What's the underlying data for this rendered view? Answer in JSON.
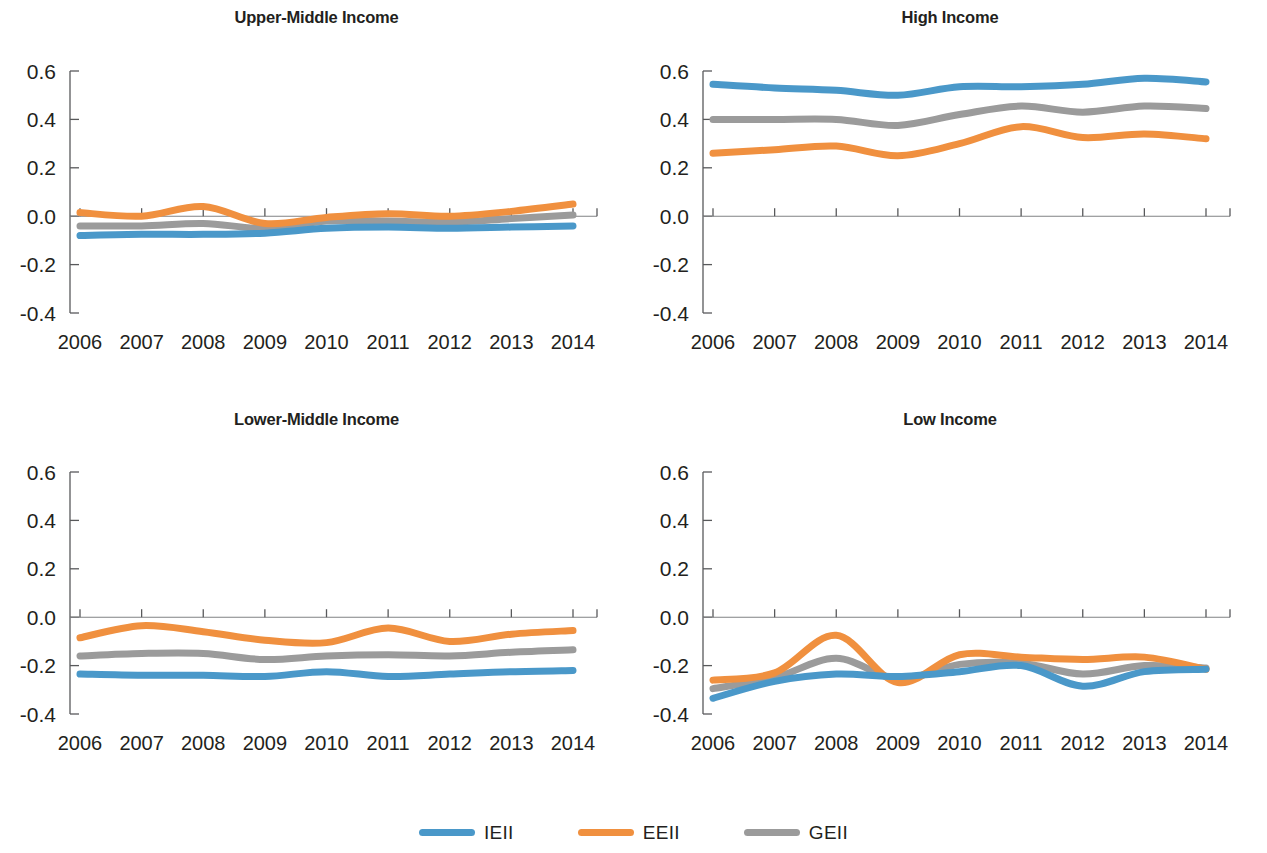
{
  "figure": {
    "series_colors": {
      "IEII": "#4a98c9",
      "EEII": "#f0903f",
      "GEII": "#9b9b9b"
    },
    "legend": {
      "position": "bottom-center",
      "items": [
        {
          "label": "IEII",
          "color": "#4a98c9",
          "icon": "line-swatch"
        },
        {
          "label": "EEII",
          "color": "#f0903f",
          "icon": "line-swatch"
        },
        {
          "label": "GEII",
          "color": "#9b9b9b",
          "icon": "line-swatch"
        }
      ]
    },
    "y_ticks": [
      "0.6",
      "0.4",
      "0.2",
      "0.0",
      "-0.2",
      "-0.4"
    ],
    "x_ticks": [
      "2006",
      "2007",
      "2008",
      "2009",
      "2010",
      "2011",
      "2012",
      "2013",
      "2014"
    ]
  },
  "panels": [
    {
      "title": "Upper-Middle Income"
    },
    {
      "title": "High Income"
    },
    {
      "title": "Lower-Middle Income"
    },
    {
      "title": "Low Income"
    }
  ],
  "chart_data": [
    {
      "type": "line",
      "title": "Upper-Middle Income",
      "xlabel": "",
      "ylabel": "",
      "x": [
        2006,
        2007,
        2008,
        2009,
        2010,
        2011,
        2012,
        2013,
        2014
      ],
      "ylim": [
        -0.4,
        0.6
      ],
      "xlim": [
        2006,
        2014
      ],
      "grid": false,
      "ytick_values": [
        0.6,
        0.4,
        0.2,
        0.0,
        -0.2,
        -0.4
      ],
      "series": [
        {
          "name": "IEII",
          "color": "#4a98c9",
          "values": [
            -0.08,
            -0.075,
            -0.075,
            -0.07,
            -0.05,
            -0.045,
            -0.05,
            -0.045,
            -0.04
          ]
        },
        {
          "name": "EEII",
          "color": "#f0903f",
          "values": [
            0.015,
            0.0,
            0.04,
            -0.03,
            -0.005,
            0.01,
            0.0,
            0.02,
            0.05
          ]
        },
        {
          "name": "GEII",
          "color": "#9b9b9b",
          "values": [
            -0.04,
            -0.04,
            -0.03,
            -0.05,
            -0.02,
            -0.02,
            -0.025,
            -0.01,
            0.005
          ]
        }
      ]
    },
    {
      "type": "line",
      "title": "High Income",
      "xlabel": "",
      "ylabel": "",
      "x": [
        2006,
        2007,
        2008,
        2009,
        2010,
        2011,
        2012,
        2013,
        2014
      ],
      "ylim": [
        -0.4,
        0.6
      ],
      "xlim": [
        2006,
        2014
      ],
      "grid": false,
      "ytick_values": [
        0.6,
        0.4,
        0.2,
        0.0,
        -0.2,
        -0.4
      ],
      "series": [
        {
          "name": "IEII",
          "color": "#4a98c9",
          "values": [
            0.545,
            0.53,
            0.52,
            0.5,
            0.535,
            0.535,
            0.545,
            0.57,
            0.555
          ]
        },
        {
          "name": "EEII",
          "color": "#f0903f",
          "values": [
            0.26,
            0.275,
            0.29,
            0.25,
            0.3,
            0.37,
            0.325,
            0.34,
            0.32
          ]
        },
        {
          "name": "GEII",
          "color": "#9b9b9b",
          "values": [
            0.4,
            0.4,
            0.4,
            0.375,
            0.42,
            0.455,
            0.43,
            0.455,
            0.445
          ]
        }
      ]
    },
    {
      "type": "line",
      "title": "Lower-Middle Income",
      "xlabel": "",
      "ylabel": "",
      "x": [
        2006,
        2007,
        2008,
        2009,
        2010,
        2011,
        2012,
        2013,
        2014
      ],
      "ylim": [
        -0.4,
        0.6
      ],
      "xlim": [
        2006,
        2014
      ],
      "grid": false,
      "ytick_values": [
        0.6,
        0.4,
        0.2,
        0.0,
        -0.2,
        -0.4
      ],
      "series": [
        {
          "name": "IEII",
          "color": "#4a98c9",
          "values": [
            -0.235,
            -0.24,
            -0.24,
            -0.245,
            -0.225,
            -0.245,
            -0.235,
            -0.225,
            -0.22
          ]
        },
        {
          "name": "EEII",
          "color": "#f0903f",
          "values": [
            -0.085,
            -0.035,
            -0.06,
            -0.095,
            -0.105,
            -0.045,
            -0.1,
            -0.07,
            -0.055
          ]
        },
        {
          "name": "GEII",
          "color": "#9b9b9b",
          "values": [
            -0.16,
            -0.15,
            -0.15,
            -0.175,
            -0.16,
            -0.155,
            -0.16,
            -0.145,
            -0.135
          ]
        }
      ]
    },
    {
      "type": "line",
      "title": "Low Income",
      "xlabel": "",
      "ylabel": "",
      "x": [
        2006,
        2007,
        2008,
        2009,
        2010,
        2011,
        2012,
        2013,
        2014
      ],
      "ylim": [
        -0.4,
        0.6
      ],
      "xlim": [
        2006,
        2014
      ],
      "grid": false,
      "ytick_values": [
        0.6,
        0.4,
        0.2,
        0.0,
        -0.2,
        -0.4
      ],
      "series": [
        {
          "name": "IEII",
          "color": "#4a98c9",
          "values": [
            -0.335,
            -0.265,
            -0.235,
            -0.245,
            -0.225,
            -0.2,
            -0.285,
            -0.225,
            -0.215
          ]
        },
        {
          "name": "EEII",
          "color": "#f0903f",
          "values": [
            -0.26,
            -0.23,
            -0.075,
            -0.27,
            -0.155,
            -0.165,
            -0.175,
            -0.165,
            -0.215
          ]
        },
        {
          "name": "GEII",
          "color": "#9b9b9b",
          "values": [
            -0.295,
            -0.25,
            -0.17,
            -0.255,
            -0.195,
            -0.19,
            -0.235,
            -0.2,
            -0.21
          ]
        }
      ]
    }
  ]
}
